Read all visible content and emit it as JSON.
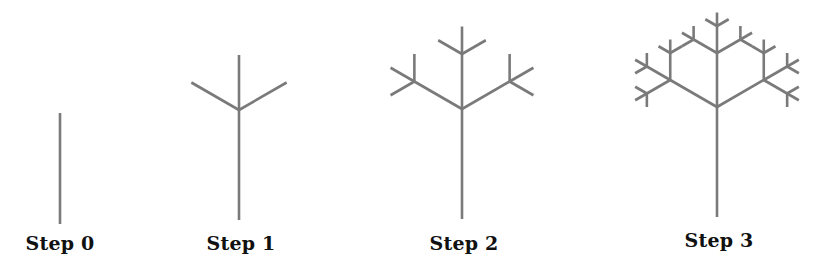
{
  "diagram": {
    "type": "fractal-tree-iterations",
    "line_color": "#7a7a7a",
    "line_width": 2.6,
    "branch_angle_deg": 60,
    "length_ratio": 0.5,
    "steps": [
      {
        "label": "Step 0",
        "depth": 0,
        "trunk_x": 60,
        "trunk_base_y": 224,
        "trunk_top_y": 113,
        "branch_len": 54,
        "label_x": 60,
        "label_y": 232
      },
      {
        "label": "Step 1",
        "depth": 1,
        "trunk_x": 239,
        "trunk_base_y": 220,
        "trunk_top_y": 110,
        "branch_len": 55,
        "label_x": 241,
        "label_y": 232
      },
      {
        "label": "Step 2",
        "depth": 2,
        "trunk_x": 462,
        "trunk_base_y": 219,
        "trunk_top_y": 109,
        "branch_len": 55,
        "label_x": 464,
        "label_y": 232
      },
      {
        "label": "Step 3",
        "depth": 3,
        "trunk_x": 717,
        "trunk_base_y": 217,
        "trunk_top_y": 107,
        "branch_len": 54,
        "label_x": 719,
        "label_y": 229
      }
    ]
  }
}
